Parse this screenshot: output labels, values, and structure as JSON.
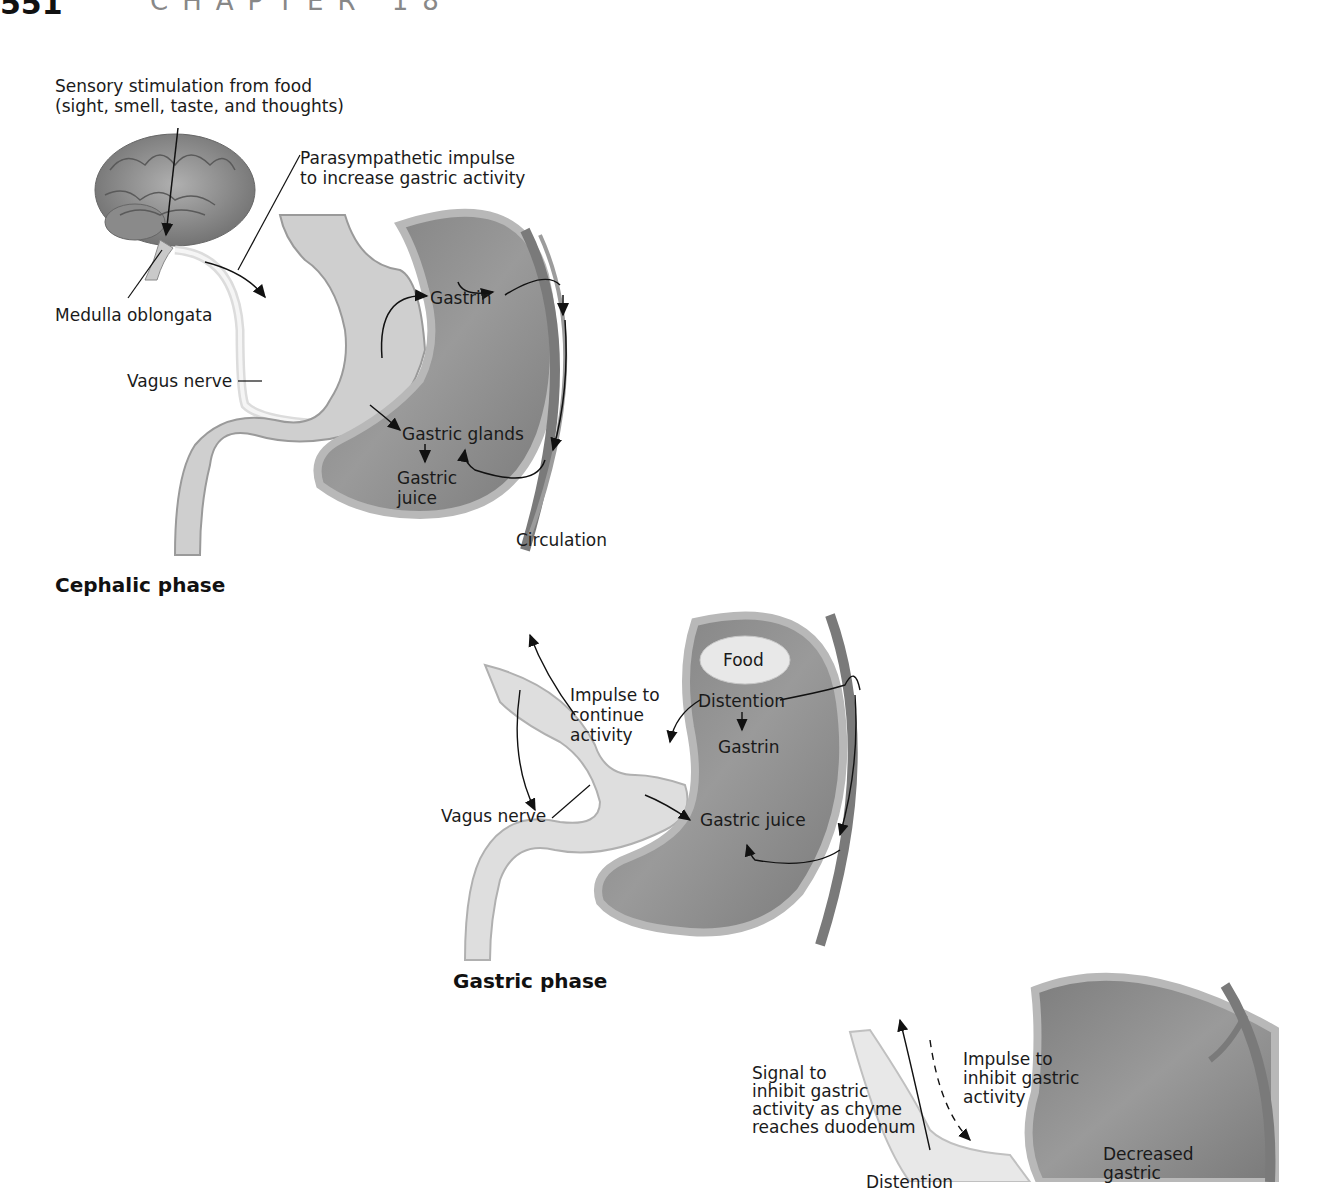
{
  "header": {
    "page_number": "551",
    "chapter": "CHAPTER 18"
  },
  "figure": {
    "cephalic": {
      "title": "Cephalic phase",
      "labels": {
        "sensory": "Sensory stimulation from food\n(sight, smell, taste, and thoughts)",
        "parasympathetic": "Parasympathetic impulse\nto increase gastric activity",
        "medulla": "Medulla oblongata",
        "vagus": "Vagus nerve",
        "gastrin": "Gastrin",
        "glands": "Gastric glands",
        "juice": "Gastric\njuice",
        "circulation": "Circulation"
      }
    },
    "gastric": {
      "title": "Gastric phase",
      "labels": {
        "food": "Food",
        "impulse": "Impulse to\ncontinue\nactivity",
        "distention": "Distention",
        "gastrin": "Gastrin",
        "vagus": "Vagus nerve",
        "juice": "Gastric juice"
      }
    },
    "intestinal": {
      "labels": {
        "signal": "Signal to\ninhibit gastric\nactivity as chyme\nreaches duodenum",
        "impulse": "Impulse to\ninhibit gastric\nactivity",
        "decreased": "Decreased\ngastric",
        "distention": "Distention"
      }
    }
  },
  "colors": {
    "stomach": "#8c8c8c",
    "wall": "#b5b5b5",
    "nerve": "#e9e9e9",
    "vessel": "#7a7a7a"
  }
}
